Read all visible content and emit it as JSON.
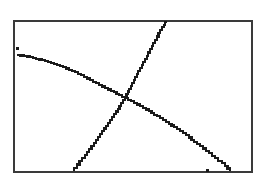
{
  "chart_data": {
    "type": "line",
    "title": "",
    "xlabel": "",
    "ylabel": "",
    "grid": false,
    "axes_visible": false,
    "legend": null,
    "frame": {
      "left_px": 14,
      "top_px": 21,
      "right_px": 252,
      "bottom_px": 172,
      "stroke": "#3a3a3a"
    },
    "series": [
      {
        "name": "decreasing curve",
        "color": "#1a1a1a",
        "style": "pixel-stepped",
        "points_px": [
          [
            17,
            55
          ],
          [
            30,
            57
          ],
          [
            45,
            61
          ],
          [
            60,
            66
          ],
          [
            75,
            72
          ],
          [
            90,
            80
          ],
          [
            105,
            88
          ],
          [
            125,
            98
          ],
          [
            140,
            106
          ],
          [
            160,
            118
          ],
          [
            180,
            131
          ],
          [
            200,
            146
          ],
          [
            215,
            158
          ],
          [
            225,
            166
          ],
          [
            230,
            171
          ]
        ]
      },
      {
        "name": "increasing curve",
        "color": "#1a1a1a",
        "style": "pixel-stepped",
        "points_px": [
          [
            74,
            171
          ],
          [
            85,
            158
          ],
          [
            100,
            137
          ],
          [
            112,
            120
          ],
          [
            125,
            100
          ],
          [
            135,
            80
          ],
          [
            145,
            62
          ],
          [
            155,
            43
          ],
          [
            162,
            30
          ],
          [
            167,
            22
          ]
        ]
      }
    ],
    "markers": [
      {
        "name": "stray pixel",
        "x_px": 17,
        "y_px": 48
      },
      {
        "name": "bottom tick",
        "x_px": 207,
        "y_px": 170
      }
    ],
    "intersection_px": [
      125,
      99
    ]
  }
}
